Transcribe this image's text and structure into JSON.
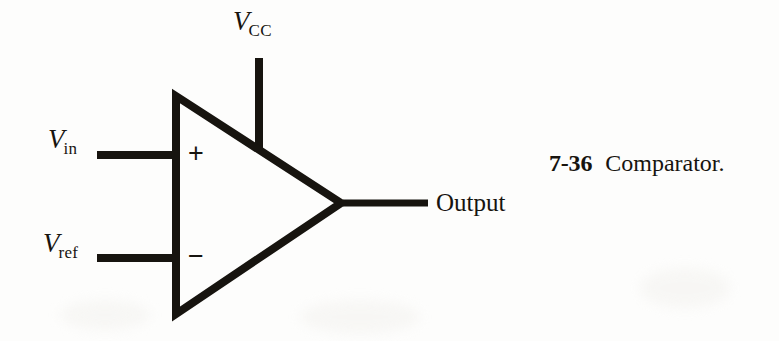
{
  "figure": {
    "caption_number": "7-36",
    "caption_text": "Comparator.",
    "background_color": "#fdfdfc",
    "ink_color": "#17140f"
  },
  "labels": {
    "vcc": {
      "symbol": "V",
      "subscript": "CC"
    },
    "vin": {
      "symbol": "V",
      "subscript": "in"
    },
    "vref": {
      "symbol": "V",
      "subscript": "ref"
    },
    "output": "Output"
  },
  "polarity": {
    "noninverting": "+",
    "inverting": "−"
  },
  "schematic": {
    "type": "comparator",
    "triangle": {
      "top_left": [
        172,
        92
      ],
      "bottom_left": [
        172,
        318
      ],
      "apex": [
        345,
        203
      ],
      "stroke_width": 8
    },
    "wires": [
      {
        "name": "vcc-supply-wire",
        "x1": 259,
        "y1": 58,
        "x2": 259,
        "y2": 151,
        "stroke_width": 8
      },
      {
        "name": "vin-input-wire",
        "x1": 97,
        "y1": 155,
        "x2": 178,
        "y2": 155,
        "stroke_width": 8
      },
      {
        "name": "vref-input-wire",
        "x1": 97,
        "y1": 258,
        "x2": 178,
        "y2": 258,
        "stroke_width": 8
      },
      {
        "name": "output-wire",
        "x1": 343,
        "y1": 203,
        "x2": 428,
        "y2": 203,
        "stroke_width": 7
      }
    ]
  }
}
